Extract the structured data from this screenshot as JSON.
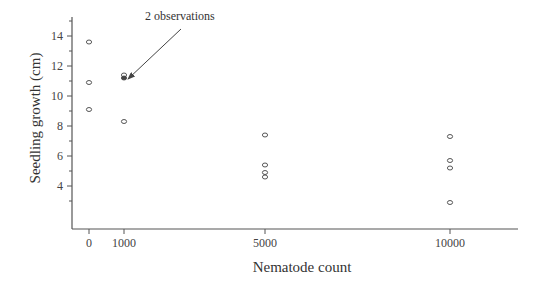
{
  "chart_data": {
    "type": "scatter",
    "title": "",
    "xlabel": "Nematode count",
    "ylabel": "Seedling growth (cm)",
    "x_ticks": [
      0,
      1000,
      5000,
      10000
    ],
    "x_tick_labels": [
      "0",
      "1000",
      "5000",
      "10000"
    ],
    "y_ticks": [
      4,
      6,
      8,
      10,
      12,
      14
    ],
    "y_tick_labels": [
      "4",
      "6",
      "8",
      "10",
      "12",
      "14"
    ],
    "ylim": [
      1.1,
      15.3
    ],
    "xlim": [
      -500,
      12000
    ],
    "grid": false,
    "legend": null,
    "points": [
      {
        "x": 0,
        "y": 13.6
      },
      {
        "x": 0,
        "y": 10.9
      },
      {
        "x": 0,
        "y": 9.1
      },
      {
        "x": 1000,
        "y": 11.4
      },
      {
        "x": 1000,
        "y": 11.2,
        "count": 2,
        "filled": true
      },
      {
        "x": 1000,
        "y": 8.3
      },
      {
        "x": 5000,
        "y": 7.4
      },
      {
        "x": 5000,
        "y": 5.4
      },
      {
        "x": 5000,
        "y": 4.9
      },
      {
        "x": 5000,
        "y": 4.6
      },
      {
        "x": 10000,
        "y": 7.3
      },
      {
        "x": 10000,
        "y": 5.7
      },
      {
        "x": 10000,
        "y": 5.2
      },
      {
        "x": 10000,
        "y": 2.9
      }
    ],
    "annotations": [
      {
        "text": "2 observations",
        "points_to": {
          "x": 1000,
          "y": 11.2
        }
      }
    ]
  },
  "colors": {
    "axis": "#555555",
    "marker": "#444444",
    "text": "#333333"
  }
}
